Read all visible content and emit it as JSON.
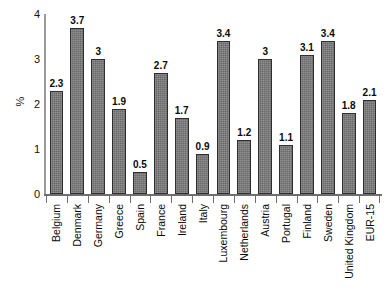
{
  "chart_data": {
    "type": "bar",
    "title": "",
    "subtitle": "",
    "xlabel": "",
    "ylabel": "%",
    "ylim": [
      0,
      4
    ],
    "yticks": [
      0,
      1,
      2,
      3,
      4
    ],
    "ytick_labels": [
      "0",
      "1",
      "2",
      "3",
      "4"
    ],
    "grid": false,
    "legend": null,
    "orientation": "vertical",
    "bar_color": "#757575",
    "bar_edge_color": "#2e2e2e",
    "value_labels_shown": true,
    "xtick_label_rotation": 90,
    "categories": [
      "Belgium",
      "Denmark",
      "Germany",
      "Greece",
      "Spain",
      "France",
      "Ireland",
      "Italy",
      "Luxembourg",
      "Netherlands",
      "Austria",
      "Portugal",
      "Finland",
      "Sweden",
      "United Kingdom",
      "EUR-15"
    ],
    "values": [
      2.3,
      3.7,
      3,
      1.9,
      0.5,
      2.7,
      1.7,
      0.9,
      3.4,
      1.2,
      3,
      1.1,
      3.1,
      3.4,
      1.8,
      2.1
    ],
    "value_labels": [
      "2.3",
      "3.7",
      "3",
      "1.9",
      "0.5",
      "2.7",
      "1.7",
      "0.9",
      "3.4",
      "1.2",
      "3",
      "1.1",
      "3.1",
      "3.4",
      "1.8",
      "2.1"
    ]
  }
}
